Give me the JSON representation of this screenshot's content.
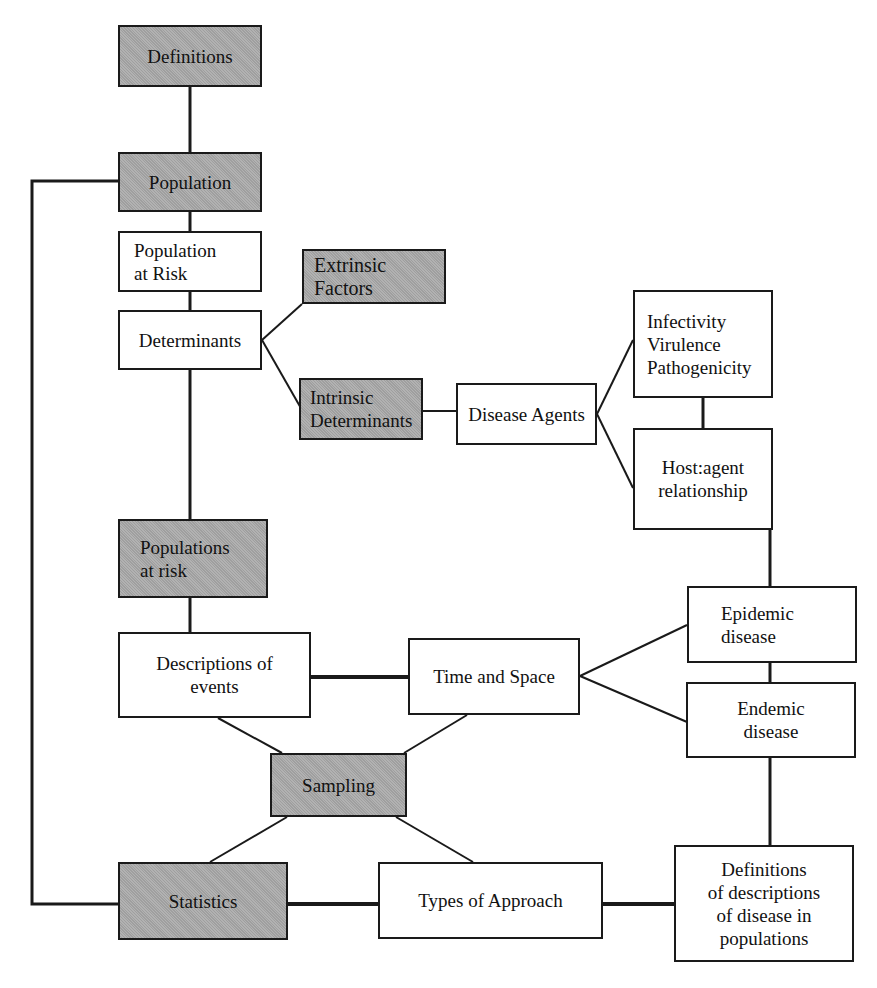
{
  "diagram": {
    "type": "concept-map",
    "colors": {
      "shaded_box": "#a9a9a9",
      "plain_box": "#ffffff",
      "line": "#1a1a1a"
    },
    "nodes": {
      "definitions": "Definitions",
      "population": "Population",
      "population_at_risk": "Population\nat Risk",
      "determinants": "Determinants",
      "extrinsic_factors": "Extrinsic\nFactors",
      "intrinsic_determinants": "Intrinsic\nDeterminants",
      "disease_agents": "Disease Agents",
      "infectivity": "Infectivity\nVirulence\n Pathogenicity",
      "host_agent": "Host:agent\nrelationship",
      "populations_at_risk": "Populations\nat risk",
      "descriptions_of_events": "Descriptions of\nevents",
      "time_and_space": "Time and Space",
      "epidemic_disease": "Epidemic\ndisease",
      "endemic_disease": "Endemic\ndisease",
      "sampling": "Sampling",
      "statistics": "Statistics",
      "types_of_approach": "Types of Approach",
      "definitions_of_descriptions": "Definitions\nof descriptions\nof disease in\npopulations"
    },
    "edges": [
      [
        "Definitions",
        "Population"
      ],
      [
        "Population",
        "Population at Risk"
      ],
      [
        "Population at Risk",
        "Determinants"
      ],
      [
        "Determinants",
        "Extrinsic Factors"
      ],
      [
        "Determinants",
        "Intrinsic Determinants"
      ],
      [
        "Intrinsic Determinants",
        "Disease Agents"
      ],
      [
        "Disease Agents",
        "Infectivity Virulence Pathogenicity"
      ],
      [
        "Disease Agents",
        "Host:agent relationship"
      ],
      [
        "Infectivity Virulence Pathogenicity",
        "Host:agent relationship"
      ],
      [
        "Determinants",
        "Populations at risk"
      ],
      [
        "Populations at risk",
        "Descriptions of events"
      ],
      [
        "Descriptions of events",
        "Time and Space"
      ],
      [
        "Host:agent relationship",
        "Epidemic disease"
      ],
      [
        "Time and Space",
        "Epidemic disease"
      ],
      [
        "Time and Space",
        "Endemic disease"
      ],
      [
        "Epidemic disease",
        "Endemic disease"
      ],
      [
        "Descriptions of events",
        "Sampling"
      ],
      [
        "Time and Space",
        "Sampling"
      ],
      [
        "Sampling",
        "Statistics"
      ],
      [
        "Sampling",
        "Types of Approach"
      ],
      [
        "Statistics",
        "Types of Approach"
      ],
      [
        "Types of Approach",
        "Definitions of descriptions of disease in populations"
      ],
      [
        "Endemic disease",
        "Definitions of descriptions of disease in populations"
      ],
      [
        "Population",
        "Statistics"
      ]
    ]
  }
}
